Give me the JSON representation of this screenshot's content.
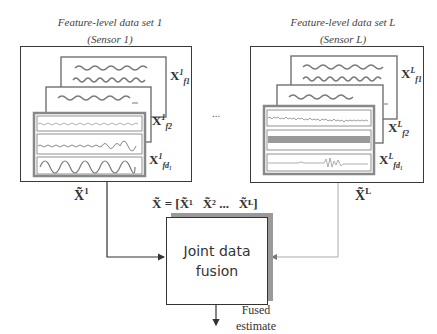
{
  "left_dataset": {
    "title_line1": "Feature-level data set 1",
    "title_line2": "(Sensor 1)",
    "matrix_labels": [
      {
        "base": "X",
        "sup": "1",
        "sub": "f1"
      },
      {
        "base": "X",
        "sup": "1",
        "sub": "f2"
      },
      {
        "base": "X",
        "sup": "1",
        "sub": "fd₁"
      }
    ],
    "output_symbol": "X̃",
    "output_sup": "1"
  },
  "ellipsis": "...",
  "right_dataset": {
    "title_line1": "Feature-level data set L",
    "title_line2": "(Sensor L)",
    "matrix_labels": [
      {
        "base": "X",
        "sup": "L",
        "sub": "f1"
      },
      {
        "base": "X",
        "sup": "L",
        "sub": "f2"
      },
      {
        "base": "X",
        "sup": "L",
        "sub": "fd₁"
      }
    ],
    "output_symbol": "X̃",
    "output_sup": "L"
  },
  "concat_equation": "X̃ = [X̃¹   X̃² ...   X̃ᴸ]",
  "fusion_box": {
    "line1": "Joint data",
    "line2": "fusion"
  },
  "output": {
    "line1": "Fused",
    "line2": "estimate"
  },
  "colors": {
    "box_border": "#3a3a3a",
    "shadow": "#9a9a9a",
    "signal": "#7a7a7a",
    "right_connector": "#b0b0b0"
  }
}
